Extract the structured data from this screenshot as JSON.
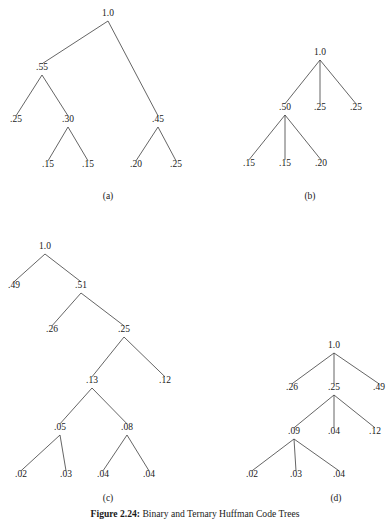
{
  "figure": {
    "caption_number": "Figure 2.24:",
    "caption_text": "Binary and Ternary Huffman Code Trees",
    "caption_top": 508,
    "background_color": "#ffffff",
    "ink_color": "#1a1a1a",
    "edge_color": "#3d3d3d"
  },
  "chart_data": {
    "type": "diagram",
    "title": "Figure 2.24: Binary and Ternary Huffman Code Trees",
    "panels": [
      {
        "id": "a",
        "label": "(a)",
        "arity": "binary",
        "label_pos": {
          "x": 108,
          "y": 199
        },
        "nodes": [
          {
            "id": "a0",
            "value": "1.0",
            "x": 108,
            "y": 16
          },
          {
            "id": "a1",
            "value": ".55",
            "x": 42,
            "y": 70
          },
          {
            "id": "a2",
            "value": ".45",
            "x": 158,
            "y": 122
          },
          {
            "id": "a3",
            "value": ".25",
            "x": 16,
            "y": 122
          },
          {
            "id": "a4",
            "value": ".30",
            "x": 68,
            "y": 122
          },
          {
            "id": "a5",
            "value": ".15",
            "x": 48,
            "y": 167
          },
          {
            "id": "a6",
            "value": ".15",
            "x": 88,
            "y": 167
          },
          {
            "id": "a7",
            "value": ".20",
            "x": 136,
            "y": 167
          },
          {
            "id": "a8",
            "value": ".25",
            "x": 176,
            "y": 167
          }
        ],
        "edges": [
          [
            "a0",
            "a1"
          ],
          [
            "a0",
            "a2"
          ],
          [
            "a1",
            "a3"
          ],
          [
            "a1",
            "a4"
          ],
          [
            "a4",
            "a5"
          ],
          [
            "a4",
            "a6"
          ],
          [
            "a2",
            "a7"
          ],
          [
            "a2",
            "a8"
          ]
        ]
      },
      {
        "id": "b",
        "label": "(b)",
        "arity": "ternary",
        "label_pos": {
          "x": 310,
          "y": 199
        },
        "nodes": [
          {
            "id": "b0",
            "value": "1.0",
            "x": 320,
            "y": 55
          },
          {
            "id": "b1",
            "value": ".50",
            "x": 285,
            "y": 110
          },
          {
            "id": "b2",
            "value": ".25",
            "x": 320,
            "y": 110
          },
          {
            "id": "b3",
            "value": ".25",
            "x": 356,
            "y": 110
          },
          {
            "id": "b4",
            "value": ".15",
            "x": 249,
            "y": 166
          },
          {
            "id": "b5",
            "value": ".15",
            "x": 285,
            "y": 166
          },
          {
            "id": "b6",
            "value": ".20",
            "x": 321,
            "y": 166
          }
        ],
        "edges": [
          [
            "b0",
            "b1"
          ],
          [
            "b0",
            "b2"
          ],
          [
            "b0",
            "b3"
          ],
          [
            "b1",
            "b4"
          ],
          [
            "b1",
            "b5"
          ],
          [
            "b1",
            "b6"
          ]
        ]
      },
      {
        "id": "c",
        "label": "(c)",
        "arity": "binary",
        "label_pos": {
          "x": 108,
          "y": 501
        },
        "nodes": [
          {
            "id": "c0",
            "value": "1.0",
            "x": 45,
            "y": 249
          },
          {
            "id": "c1",
            "value": ".49",
            "x": 14,
            "y": 288
          },
          {
            "id": "c2",
            "value": ".51",
            "x": 81,
            "y": 288
          },
          {
            "id": "c3",
            "value": ".26",
            "x": 52,
            "y": 332
          },
          {
            "id": "c4",
            "value": ".25",
            "x": 124,
            "y": 332
          },
          {
            "id": "c5",
            "value": ".13",
            "x": 92,
            "y": 383
          },
          {
            "id": "c6",
            "value": ".12",
            "x": 165,
            "y": 383
          },
          {
            "id": "c7",
            "value": ".05",
            "x": 60,
            "y": 430
          },
          {
            "id": "c8",
            "value": ".08",
            "x": 127,
            "y": 430
          },
          {
            "id": "c9",
            "value": ".02",
            "x": 21,
            "y": 477
          },
          {
            "id": "c10",
            "value": ".03",
            "x": 66,
            "y": 477
          },
          {
            "id": "c11",
            "value": ".04",
            "x": 103,
            "y": 477
          },
          {
            "id": "c12",
            "value": ".04",
            "x": 149,
            "y": 477
          }
        ],
        "edges": [
          [
            "c0",
            "c1"
          ],
          [
            "c0",
            "c2"
          ],
          [
            "c2",
            "c3"
          ],
          [
            "c2",
            "c4"
          ],
          [
            "c4",
            "c5"
          ],
          [
            "c4",
            "c6"
          ],
          [
            "c5",
            "c7"
          ],
          [
            "c5",
            "c8"
          ],
          [
            "c7",
            "c9"
          ],
          [
            "c7",
            "c10"
          ],
          [
            "c8",
            "c11"
          ],
          [
            "c8",
            "c12"
          ]
        ]
      },
      {
        "id": "d",
        "label": "(d)",
        "arity": "ternary",
        "label_pos": {
          "x": 336,
          "y": 501
        },
        "nodes": [
          {
            "id": "d0",
            "value": "1.0",
            "x": 334,
            "y": 348
          },
          {
            "id": "d1",
            "value": ".26",
            "x": 292,
            "y": 390
          },
          {
            "id": "d2",
            "value": ".25",
            "x": 334,
            "y": 390
          },
          {
            "id": "d3",
            "value": ".49",
            "x": 379,
            "y": 390
          },
          {
            "id": "d4",
            "value": ".09",
            "x": 294,
            "y": 434
          },
          {
            "id": "d5",
            "value": ".04",
            "x": 334,
            "y": 434
          },
          {
            "id": "d6",
            "value": ".12",
            "x": 375,
            "y": 434
          },
          {
            "id": "d7",
            "value": ".02",
            "x": 252,
            "y": 477
          },
          {
            "id": "d8",
            "value": ".03",
            "x": 296,
            "y": 477
          },
          {
            "id": "d9",
            "value": ".04",
            "x": 339,
            "y": 477
          }
        ],
        "edges": [
          [
            "d0",
            "d1"
          ],
          [
            "d0",
            "d2"
          ],
          [
            "d0",
            "d3"
          ],
          [
            "d2",
            "d4"
          ],
          [
            "d2",
            "d5"
          ],
          [
            "d2",
            "d6"
          ],
          [
            "d4",
            "d7"
          ],
          [
            "d4",
            "d8"
          ],
          [
            "d4",
            "d9"
          ]
        ]
      }
    ]
  }
}
